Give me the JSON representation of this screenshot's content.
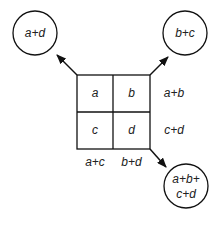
{
  "cells": {
    "a": "a",
    "b": "b",
    "c": "c",
    "d": "d"
  },
  "row_sums": {
    "top": "a+b",
    "bottom": "c+d"
  },
  "col_sums": {
    "left": "a+c",
    "right": "b+d"
  },
  "circles": {
    "diag_main": "a+d",
    "diag_anti": "b+c",
    "total_line1": "a+b+",
    "total_line2": "c+d"
  }
}
